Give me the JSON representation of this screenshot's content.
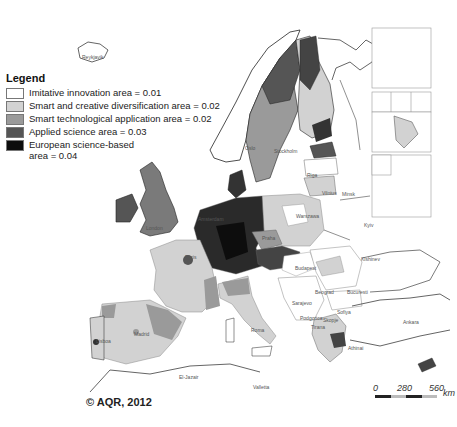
{
  "legend": {
    "title": "Legend",
    "items": [
      {
        "label": "Imitative innovation area = 0.01",
        "color": "#ffffff"
      },
      {
        "label": "Smart and creative diversification area = 0.02",
        "color": "#d2d2d2"
      },
      {
        "label": "Smart technological application area = 0.02",
        "color": "#9a9a9a"
      },
      {
        "label": "Applied science area = 0.03",
        "color": "#555555"
      },
      {
        "label": "European science-based area = 0.04",
        "label_line1": "European science-based",
        "label_line2": "area = 0.04",
        "color": "#0d0d0d"
      }
    ]
  },
  "copyright": "© AQR, 2012",
  "scale": {
    "ticks": [
      "0",
      "280",
      "560"
    ],
    "unit": "km"
  },
  "cities": [
    {
      "name": "Reykjavik",
      "x": 82,
      "y": 54
    },
    {
      "name": "Oslo",
      "x": 245,
      "y": 145
    },
    {
      "name": "Stockholm",
      "x": 274,
      "y": 148
    },
    {
      "name": "Riga",
      "x": 307,
      "y": 172
    },
    {
      "name": "Vilnius",
      "x": 322,
      "y": 190
    },
    {
      "name": "Minsk",
      "x": 342,
      "y": 191
    },
    {
      "name": "Warszawa",
      "x": 296,
      "y": 213
    },
    {
      "name": "Kyiv",
      "x": 364,
      "y": 222
    },
    {
      "name": "London",
      "x": 146,
      "y": 225
    },
    {
      "name": "Amsterdam",
      "x": 198,
      "y": 216
    },
    {
      "name": "Paris",
      "x": 185,
      "y": 254
    },
    {
      "name": "Praha",
      "x": 262,
      "y": 235
    },
    {
      "name": "Budapest",
      "x": 295,
      "y": 265
    },
    {
      "name": "Kishinev",
      "x": 361,
      "y": 256
    },
    {
      "name": "Beograd",
      "x": 315,
      "y": 289
    },
    {
      "name": "Bucuresti",
      "x": 347,
      "y": 289
    },
    {
      "name": "Sarajevo",
      "x": 292,
      "y": 300
    },
    {
      "name": "Sofiya",
      "x": 337,
      "y": 309
    },
    {
      "name": "Podgorica",
      "x": 300,
      "y": 315
    },
    {
      "name": "Skopje",
      "x": 323,
      "y": 317
    },
    {
      "name": "Tirana",
      "x": 311,
      "y": 324
    },
    {
      "name": "Madrid",
      "x": 134,
      "y": 331
    },
    {
      "name": "Lisboa",
      "x": 96,
      "y": 338
    },
    {
      "name": "Roma",
      "x": 251,
      "y": 327
    },
    {
      "name": "Ankara",
      "x": 403,
      "y": 319
    },
    {
      "name": "El-Jazair",
      "x": 179,
      "y": 374
    },
    {
      "name": "Valletta",
      "x": 253,
      "y": 384
    },
    {
      "name": "Athinai",
      "x": 348,
      "y": 345
    }
  ],
  "insets": [
    {
      "name": "Canarias"
    },
    {
      "name": "Guadeloupe"
    },
    {
      "name": "Martinique"
    },
    {
      "name": "Réunion"
    },
    {
      "name": "Guyane"
    },
    {
      "name": "Madeira"
    },
    {
      "name": "Açores"
    }
  ]
}
